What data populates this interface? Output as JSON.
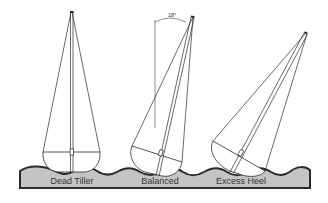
{
  "diagram": {
    "angle_label": "18°",
    "boats": [
      {
        "id": "dead-tiller",
        "label": "Dead Tiller",
        "heel_deg": 0
      },
      {
        "id": "balanced",
        "label": "Balanced",
        "heel_deg": 18
      },
      {
        "id": "excess-heel",
        "label": "Excess Heel",
        "heel_deg": 35
      }
    ],
    "colors": {
      "water_fill": "#c4c4c4",
      "outline": "#2a2a2a",
      "label_text": "#333333",
      "background": "#ffffff"
    }
  }
}
